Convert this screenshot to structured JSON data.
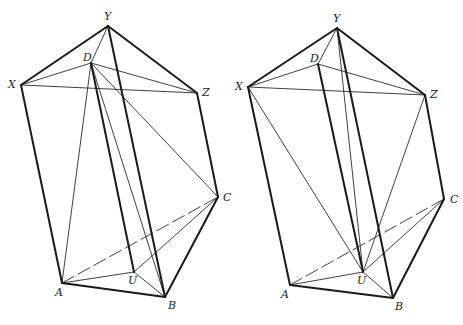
{
  "figures": [
    {
      "id": "left",
      "points": {
        "Y": [
          108,
          26
        ],
        "D": [
          91,
          63
        ],
        "X": [
          21,
          85
        ],
        "Z": [
          197,
          93
        ],
        "C": [
          218,
          197
        ],
        "A": [
          62,
          283
        ],
        "U": [
          134,
          272
        ],
        "B": [
          165,
          297
        ]
      },
      "labels": {
        "Y": {
          "text": "Y",
          "dx": -4,
          "dy": -6
        },
        "D": {
          "text": "D",
          "dx": -8,
          "dy": -2
        },
        "X": {
          "text": "X",
          "dx": -13,
          "dy": 3
        },
        "Z": {
          "text": "Z",
          "dx": 5,
          "dy": 3
        },
        "C": {
          "text": "C",
          "dx": 5,
          "dy": 4
        },
        "A": {
          "text": "A",
          "dx": -7,
          "dy": 13
        },
        "U": {
          "text": "U",
          "dx": -6,
          "dy": 12
        },
        "B": {
          "text": "B",
          "dx": 3,
          "dy": 12
        }
      },
      "thick": [
        [
          "X",
          "Y"
        ],
        [
          "Y",
          "Z"
        ],
        [
          "X",
          "A"
        ],
        [
          "Z",
          "C"
        ],
        [
          "A",
          "B"
        ],
        [
          "B",
          "C"
        ],
        [
          "Y",
          "B"
        ],
        [
          "D",
          "U"
        ]
      ],
      "thin": [
        [
          "X",
          "Z"
        ],
        [
          "X",
          "D"
        ],
        [
          "D",
          "Z"
        ],
        [
          "D",
          "Y"
        ],
        [
          "D",
          "A"
        ],
        [
          "D",
          "B"
        ],
        [
          "D",
          "C"
        ],
        [
          "A",
          "U"
        ],
        [
          "U",
          "B"
        ],
        [
          "U",
          "C"
        ]
      ],
      "dashed": [
        [
          "A",
          "C"
        ]
      ]
    },
    {
      "id": "right",
      "points": {
        "Y": [
          337,
          28
        ],
        "D": [
          318,
          64
        ],
        "X": [
          248,
          87
        ],
        "Z": [
          425,
          95
        ],
        "C": [
          444,
          199
        ],
        "A": [
          290,
          285
        ],
        "U": [
          363,
          272
        ],
        "B": [
          393,
          298
        ]
      },
      "labels": {
        "Y": {
          "text": "Y",
          "dx": -4,
          "dy": -6
        },
        "D": {
          "text": "D",
          "dx": -8,
          "dy": -2
        },
        "X": {
          "text": "X",
          "dx": -13,
          "dy": 3
        },
        "Z": {
          "text": "Z",
          "dx": 5,
          "dy": 3
        },
        "C": {
          "text": "C",
          "dx": 6,
          "dy": 4
        },
        "A": {
          "text": "A",
          "dx": -9,
          "dy": 13
        },
        "U": {
          "text": "U",
          "dx": -6,
          "dy": 12
        },
        "B": {
          "text": "B",
          "dx": 2,
          "dy": 12
        }
      },
      "thick": [
        [
          "X",
          "Y"
        ],
        [
          "Y",
          "Z"
        ],
        [
          "X",
          "A"
        ],
        [
          "Z",
          "C"
        ],
        [
          "A",
          "B"
        ],
        [
          "B",
          "C"
        ],
        [
          "Y",
          "B"
        ],
        [
          "D",
          "U"
        ]
      ],
      "thin": [
        [
          "X",
          "Z"
        ],
        [
          "X",
          "D"
        ],
        [
          "D",
          "Z"
        ],
        [
          "D",
          "Y"
        ],
        [
          "X",
          "U"
        ],
        [
          "Y",
          "U"
        ],
        [
          "Z",
          "U"
        ],
        [
          "A",
          "U"
        ],
        [
          "U",
          "B"
        ],
        [
          "U",
          "C"
        ]
      ],
      "dashed": [
        [
          "A",
          "C"
        ]
      ]
    }
  ]
}
